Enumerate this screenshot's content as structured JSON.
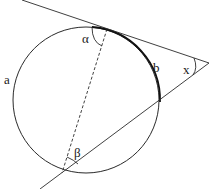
{
  "diagram": {
    "type": "circle-tangent-secant",
    "colors": {
      "background": "#ffffff",
      "stroke": "#2a2a2a",
      "arc_b": "#111111"
    },
    "circle": {
      "cx": 86,
      "cy": 100,
      "r": 73
    },
    "tangent_line": {
      "x1": 22,
      "y1": 0,
      "x2": 209,
      "y2": 63
    },
    "secant_line": {
      "x1": 40,
      "y1": 189,
      "x2": 209,
      "y2": 63
    },
    "dashed_chord": {
      "x1": 107,
      "y1": 29,
      "x2": 62,
      "y2": 173
    },
    "labels": {
      "alpha": "α",
      "beta": "β",
      "a": "a",
      "b": "b",
      "x": "x"
    }
  }
}
